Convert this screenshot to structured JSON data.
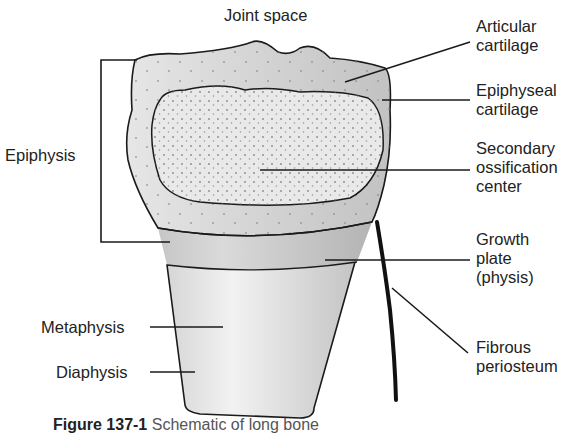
{
  "diagram": {
    "title": "Joint space",
    "labels": {
      "articular_cartilage": [
        "Articular",
        "cartilage"
      ],
      "epiphyseal_cartilage": [
        "Epiphyseal",
        "cartilage"
      ],
      "secondary_ossification": [
        "Secondary",
        "ossification",
        "center"
      ],
      "growth_plate": [
        "Growth",
        "plate",
        "(physis)"
      ],
      "fibrous_periosteum": [
        "Fibrous",
        "periosteum"
      ],
      "epiphysis": "Epiphysis",
      "metaphysis": "Metaphysis",
      "diaphysis": "Diaphysis"
    },
    "caption": {
      "figure_number": "Figure 137-1",
      "text": "Schematic of long bone"
    },
    "colors": {
      "outline": "#1a1a1a",
      "cartilage": "#c8c8c8",
      "ossification": "#e4e4e4",
      "growth_plate": "#b8b8b8",
      "shaft": "#d8d8d8"
    }
  }
}
